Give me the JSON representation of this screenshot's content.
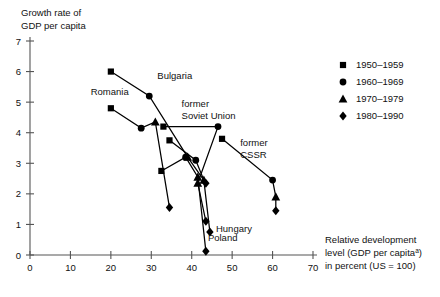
{
  "chart_data": {
    "type": "scatter",
    "title": "",
    "ylabel_lines": [
      "Growth rate of",
      "GDP per capita"
    ],
    "xlabel_lines": [
      "Relative development",
      "level (GDP per capita",
      "in percent (US = 100)"
    ],
    "xlabel_superscript": "a",
    "xlim": [
      0,
      70
    ],
    "ylim": [
      0,
      7
    ],
    "xticks": [
      0,
      10,
      20,
      30,
      40,
      50,
      60,
      70
    ],
    "yticks": [
      0,
      1,
      2,
      3,
      4,
      5,
      6,
      7
    ],
    "grid": false,
    "legend_position": "right",
    "legend": [
      {
        "marker": "square",
        "label": "1950–1959"
      },
      {
        "marker": "circle",
        "label": "1960–1969"
      },
      {
        "marker": "triangle",
        "label": "1970–1979"
      },
      {
        "marker": "diamond",
        "label": "1980–1990"
      }
    ],
    "series": [
      {
        "name": "Bulgaria",
        "label": "Bulgaria",
        "label_x": 31.5,
        "label_y": 5.75,
        "points": [
          {
            "x": 20.0,
            "y": 6.0,
            "marker": "square"
          },
          {
            "x": 29.5,
            "y": 5.2,
            "marker": "circle"
          },
          {
            "x": 39.0,
            "y": 3.2,
            "marker": "triangle"
          },
          {
            "x": 43.5,
            "y": 2.35,
            "marker": "diamond"
          }
        ]
      },
      {
        "name": "Romania",
        "label": "Romania",
        "label_x": 15.0,
        "label_y": 5.25,
        "points": [
          {
            "x": 20.0,
            "y": 4.8,
            "marker": "square"
          },
          {
            "x": 27.5,
            "y": 4.15,
            "marker": "circle"
          },
          {
            "x": 31.0,
            "y": 4.35,
            "marker": "triangle"
          },
          {
            "x": 34.5,
            "y": 1.55,
            "marker": "diamond"
          }
        ]
      },
      {
        "name": "former Soviet Union",
        "label": "former\nSoviet Union",
        "label_x": 37.5,
        "label_y": 4.85,
        "points": [
          {
            "x": 33.0,
            "y": 4.2,
            "marker": "square"
          },
          {
            "x": 46.5,
            "y": 4.2,
            "marker": "circle"
          },
          {
            "x": 41.5,
            "y": 2.35,
            "marker": "triangle"
          },
          {
            "x": 43.5,
            "y": 1.1,
            "marker": "diamond"
          }
        ]
      },
      {
        "name": "Hungary",
        "label": "Hungary",
        "label_x": 46.0,
        "label_y": 0.75,
        "points": [
          {
            "x": 34.5,
            "y": 3.75,
            "marker": "square"
          },
          {
            "x": 41.0,
            "y": 3.1,
            "marker": "circle"
          },
          {
            "x": 43.0,
            "y": 2.45,
            "marker": "triangle"
          },
          {
            "x": 44.5,
            "y": 0.75,
            "marker": "diamond"
          }
        ]
      },
      {
        "name": "Poland",
        "label": "Poland",
        "label_x": 44.0,
        "label_y": 0.45,
        "points": [
          {
            "x": 32.5,
            "y": 2.75,
            "marker": "square"
          },
          {
            "x": 38.5,
            "y": 3.2,
            "marker": "circle"
          },
          {
            "x": 41.5,
            "y": 2.55,
            "marker": "triangle"
          },
          {
            "x": 43.5,
            "y": 0.12,
            "marker": "diamond"
          }
        ]
      },
      {
        "name": "former CSSR",
        "label": "former\nCSSR",
        "label_x": 52.0,
        "label_y": 3.55,
        "points": [
          {
            "x": 47.5,
            "y": 3.8,
            "marker": "square"
          },
          {
            "x": 60.0,
            "y": 2.45,
            "marker": "circle"
          },
          {
            "x": 60.8,
            "y": 1.9,
            "marker": "triangle"
          },
          {
            "x": 60.8,
            "y": 1.45,
            "marker": "diamond"
          }
        ]
      }
    ]
  }
}
